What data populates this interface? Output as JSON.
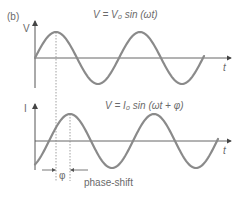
{
  "panel_label": "(b)",
  "top_graph": {
    "y_axis_label": "V",
    "x_axis_label": "t",
    "equation": "V = V₀ sin (ωt)"
  },
  "bottom_graph": {
    "y_axis_label": "I",
    "x_axis_label": "t",
    "equation": "V = I₀ sin (ωt + φ)"
  },
  "phase_symbol": "φ",
  "phase_label": "phase-shift",
  "colors": {
    "curve": "#8a8a8a",
    "axis": "#555555",
    "dashed": "#888888",
    "text": "#6a6a6a"
  }
}
